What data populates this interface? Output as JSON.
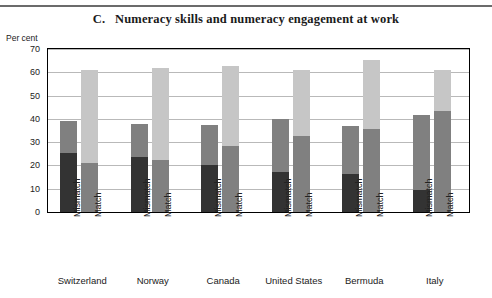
{
  "figure": {
    "panel_letter": "C.",
    "title": "C.   Numeracy skills and numeracy engagement at work",
    "unit_label": "Per cent"
  },
  "chart_data": {
    "type": "bar",
    "subtype": "stacked-bar-grouped",
    "title": "C.   Numeracy skills and numeracy engagement at work",
    "xlabel": "",
    "ylabel": "Per cent",
    "ylim": [
      0,
      70
    ],
    "yticks": [
      0,
      10,
      20,
      30,
      40,
      50,
      60,
      70
    ],
    "ytick_labels": [
      "0",
      "10",
      "20",
      "30",
      "40",
      "50",
      "60",
      "70"
    ],
    "grid": true,
    "legend_position": "none",
    "categories": [
      "Switzerland",
      "Norway",
      "Canada",
      "United States",
      "Bermuda",
      "Italy"
    ],
    "subcategories": [
      "Mismatch",
      "Match"
    ],
    "series": [
      {
        "name": "lower-segment",
        "color": "#333333"
      },
      {
        "name": "upper-segment",
        "color": "#808080"
      },
      {
        "name": "top-segment",
        "color": "#c6c6c6"
      }
    ],
    "bars": [
      {
        "country": "Switzerland",
        "group": "Mismatch",
        "segments": [
          {
            "series": "lower-segment",
            "value": 25.5,
            "color": "#333333"
          },
          {
            "series": "upper-segment",
            "value": 13.5,
            "color": "#808080"
          }
        ],
        "total": 39.0
      },
      {
        "country": "Switzerland",
        "group": "Match",
        "segments": [
          {
            "series": "upper-segment",
            "value": 21.0,
            "color": "#808080"
          },
          {
            "series": "top-segment",
            "value": 40.0,
            "color": "#c6c6c6"
          }
        ],
        "total": 61.0
      },
      {
        "country": "Norway",
        "group": "Mismatch",
        "segments": [
          {
            "series": "lower-segment",
            "value": 23.8,
            "color": "#333333"
          },
          {
            "series": "upper-segment",
            "value": 14.2,
            "color": "#808080"
          }
        ],
        "total": 38.0
      },
      {
        "country": "Norway",
        "group": "Match",
        "segments": [
          {
            "series": "upper-segment",
            "value": 22.5,
            "color": "#808080"
          },
          {
            "series": "top-segment",
            "value": 39.5,
            "color": "#c6c6c6"
          }
        ],
        "total": 62.0
      },
      {
        "country": "Canada",
        "group": "Mismatch",
        "segments": [
          {
            "series": "lower-segment",
            "value": 20.3,
            "color": "#333333"
          },
          {
            "series": "upper-segment",
            "value": 17.2,
            "color": "#808080"
          }
        ],
        "total": 37.5
      },
      {
        "country": "Canada",
        "group": "Match",
        "segments": [
          {
            "series": "upper-segment",
            "value": 28.3,
            "color": "#808080"
          },
          {
            "series": "top-segment",
            "value": 34.2,
            "color": "#c6c6c6"
          }
        ],
        "total": 62.5
      },
      {
        "country": "United States",
        "group": "Mismatch",
        "segments": [
          {
            "series": "lower-segment",
            "value": 17.3,
            "color": "#333333"
          },
          {
            "series": "upper-segment",
            "value": 22.7,
            "color": "#808080"
          }
        ],
        "total": 40.0
      },
      {
        "country": "United States",
        "group": "Match",
        "segments": [
          {
            "series": "upper-segment",
            "value": 32.5,
            "color": "#808080"
          },
          {
            "series": "top-segment",
            "value": 28.5,
            "color": "#c6c6c6"
          }
        ],
        "total": 61.0
      },
      {
        "country": "Bermuda",
        "group": "Mismatch",
        "segments": [
          {
            "series": "lower-segment",
            "value": 16.5,
            "color": "#333333"
          },
          {
            "series": "upper-segment",
            "value": 20.3,
            "color": "#808080"
          }
        ],
        "total": 36.8
      },
      {
        "country": "Bermuda",
        "group": "Match",
        "segments": [
          {
            "series": "upper-segment",
            "value": 35.5,
            "color": "#808080"
          },
          {
            "series": "top-segment",
            "value": 30.0,
            "color": "#c6c6c6"
          }
        ],
        "total": 65.5
      },
      {
        "country": "Italy",
        "group": "Mismatch",
        "segments": [
          {
            "series": "lower-segment",
            "value": 9.5,
            "color": "#333333"
          },
          {
            "series": "upper-segment",
            "value": 32.0,
            "color": "#808080"
          }
        ],
        "total": 41.5
      },
      {
        "country": "Italy",
        "group": "Match",
        "segments": [
          {
            "series": "upper-segment",
            "value": 43.5,
            "color": "#808080"
          },
          {
            "series": "top-segment",
            "value": 17.5,
            "color": "#c6c6c6"
          }
        ],
        "total": 61.0
      }
    ]
  },
  "colors": {
    "dark_segment": "#333333",
    "mid_segment": "#808080",
    "light_segment": "#c6c6c6",
    "gridline": "#b9b9b9",
    "axis": "#000000",
    "rule": "#6b6b6b"
  }
}
